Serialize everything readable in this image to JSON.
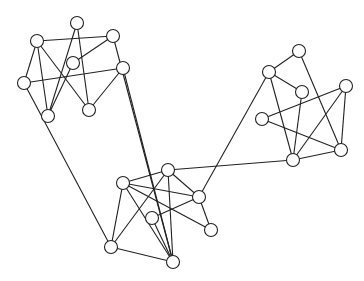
{
  "graph": {
    "node_radius": 6.5,
    "colors": {
      "stroke": "#222222",
      "fill": "#ffffff",
      "background": "#ffffff"
    },
    "nodes": [
      {
        "id": "A",
        "x": 77,
        "y": 23
      },
      {
        "id": "B",
        "x": 37,
        "y": 41
      },
      {
        "id": "C",
        "x": 113,
        "y": 36
      },
      {
        "id": "D",
        "x": 73,
        "y": 63
      },
      {
        "id": "E",
        "x": 123,
        "y": 68
      },
      {
        "id": "F",
        "x": 24,
        "y": 83
      },
      {
        "id": "G",
        "x": 48,
        "y": 116
      },
      {
        "id": "H",
        "x": 89,
        "y": 110
      },
      {
        "id": "I",
        "x": 123,
        "y": 183
      },
      {
        "id": "J",
        "x": 168,
        "y": 170
      },
      {
        "id": "K",
        "x": 199,
        "y": 197
      },
      {
        "id": "L",
        "x": 152,
        "y": 218
      },
      {
        "id": "M",
        "x": 211,
        "y": 230
      },
      {
        "id": "N",
        "x": 111,
        "y": 247
      },
      {
        "id": "O",
        "x": 173,
        "y": 262
      },
      {
        "id": "P",
        "x": 299,
        "y": 51
      },
      {
        "id": "Q",
        "x": 269,
        "y": 72
      },
      {
        "id": "R",
        "x": 302,
        "y": 92
      },
      {
        "id": "S",
        "x": 346,
        "y": 86
      },
      {
        "id": "T",
        "x": 262,
        "y": 119
      },
      {
        "id": "U",
        "x": 341,
        "y": 150
      },
      {
        "id": "V",
        "x": 293,
        "y": 160
      }
    ],
    "edges": [
      [
        "B",
        "C"
      ],
      [
        "B",
        "F"
      ],
      [
        "B",
        "G"
      ],
      [
        "B",
        "H"
      ],
      [
        "A",
        "G"
      ],
      [
        "A",
        "H"
      ],
      [
        "C",
        "D"
      ],
      [
        "D",
        "G"
      ],
      [
        "F",
        "E"
      ],
      [
        "E",
        "H"
      ],
      [
        "C",
        "O"
      ],
      [
        "F",
        "N"
      ],
      [
        "E",
        "O"
      ],
      [
        "I",
        "J"
      ],
      [
        "I",
        "K"
      ],
      [
        "I",
        "M"
      ],
      [
        "I",
        "N"
      ],
      [
        "I",
        "O"
      ],
      [
        "J",
        "N"
      ],
      [
        "J",
        "O"
      ],
      [
        "J",
        "K"
      ],
      [
        "L",
        "K"
      ],
      [
        "N",
        "O"
      ],
      [
        "K",
        "M"
      ],
      [
        "J",
        "V"
      ],
      [
        "K",
        "Q"
      ],
      [
        "L",
        "O"
      ],
      [
        "Q",
        "P"
      ],
      [
        "Q",
        "R"
      ],
      [
        "Q",
        "V"
      ],
      [
        "P",
        "U"
      ],
      [
        "R",
        "V"
      ],
      [
        "T",
        "S"
      ],
      [
        "T",
        "U"
      ],
      [
        "S",
        "V"
      ],
      [
        "S",
        "U"
      ],
      [
        "U",
        "V"
      ]
    ]
  }
}
